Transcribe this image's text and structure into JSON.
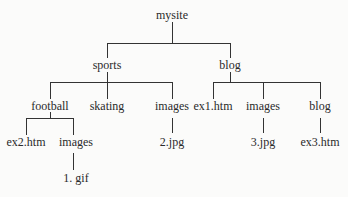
{
  "diagram": {
    "type": "tree",
    "root": "mysite",
    "nodes": {
      "mysite": "mysite",
      "sports": "sports",
      "blog": "blog",
      "football": "football",
      "skating": "skating",
      "sports_images": "images",
      "ex1": "ex1.htm",
      "blog_images": "images",
      "blog_blog": "blog",
      "ex2": "ex2.htm",
      "football_images": "images",
      "jpg2": "2.jpg",
      "jpg3": "3.jpg",
      "ex3": "ex3.htm",
      "gif1": "1. gif"
    },
    "edges": [
      [
        "mysite",
        "sports"
      ],
      [
        "mysite",
        "blog"
      ],
      [
        "sports",
        "football"
      ],
      [
        "sports",
        "skating"
      ],
      [
        "sports",
        "images"
      ],
      [
        "blog",
        "ex1.htm"
      ],
      [
        "blog",
        "images"
      ],
      [
        "blog",
        "blog"
      ],
      [
        "football",
        "ex2.htm"
      ],
      [
        "football",
        "images"
      ],
      [
        "images",
        "2.jpg"
      ],
      [
        "images",
        "3.jpg"
      ],
      [
        "blog",
        "ex3.htm"
      ],
      [
        "images",
        "1. gif"
      ]
    ]
  }
}
